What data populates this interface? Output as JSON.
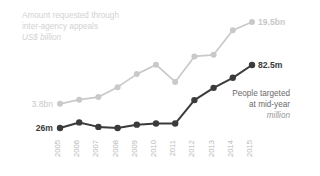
{
  "chart_data": {
    "type": "line",
    "title": "Amount requested through inter-agency appeals",
    "subtitle": "US$ billion",
    "xlabel": "",
    "ylabel": "",
    "grid": false,
    "legend_position": "inline-end-labels",
    "categories": [
      "2005",
      "2006",
      "2007",
      "2008",
      "2009",
      "2010",
      "2011",
      "2012",
      "2013",
      "2014",
      "2015"
    ],
    "series": [
      {
        "name": "Amount requested through inter-agency appeals",
        "unit": "US$ billion",
        "color": "#c9c9c9",
        "start_label": "3.8bn",
        "end_label": "19.5bn",
        "values": [
          3.8,
          4.6,
          5.1,
          7.0,
          9.5,
          11.3,
          8.0,
          12.9,
          13.2,
          17.9,
          19.5
        ]
      },
      {
        "name": "People targeted at mid-year",
        "unit": "million",
        "color": "#3b3b3b",
        "start_label": "26m",
        "end_label": "82.5m",
        "values": [
          26,
          31,
          27,
          26,
          29,
          30,
          30,
          51,
          62,
          71,
          82.5
        ]
      }
    ],
    "annotations": [
      {
        "text": "People targeted",
        "series": "People targeted at mid-year"
      },
      {
        "text": "at mid-year",
        "series": "People targeted at mid-year"
      },
      {
        "text": "million",
        "series": "People targeted at mid-year",
        "italic": true
      }
    ],
    "ylim_bn": [
      0,
      22
    ],
    "ylim_m": [
      0,
      95
    ]
  },
  "title": {
    "line1": "Amount requested through",
    "line2": "inter-agency appeals",
    "line3": "US$ billion"
  },
  "annotation": {
    "line1": "People targeted",
    "line2": "at mid-year",
    "line3": "million"
  },
  "labels": {
    "grey_start": "3.8bn",
    "grey_end": "19.5bn",
    "dark_start": "26m",
    "dark_end": "82.5m"
  },
  "colors": {
    "grey_series": "#c9c9c9",
    "dark_series": "#3b3b3b",
    "title_text": "#d2d2d2",
    "tick_text": "#b9b9b9",
    "annotation_text": "#6b6b6b"
  },
  "axis": {
    "ticks": [
      "2005",
      "2006",
      "2007",
      "2008",
      "2009",
      "2010",
      "2011",
      "2012",
      "2013",
      "2014",
      "2015"
    ]
  }
}
